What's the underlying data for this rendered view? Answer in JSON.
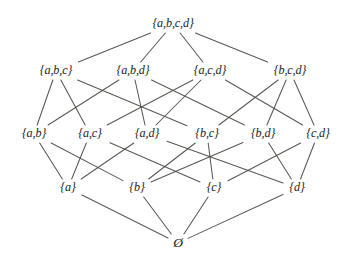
{
  "diagram": {
    "type": "hasse-lattice",
    "background_color": "#ffffff",
    "line_color": "#4a4a47",
    "text_color": "#1d1d1b",
    "width": 349,
    "height": 259,
    "levels": [
      {
        "rank": 4,
        "y": 24,
        "label": "four-element subsets"
      },
      {
        "rank": 3,
        "y": 71,
        "label": "three-element subsets"
      },
      {
        "rank": 2,
        "y": 134,
        "label": "two-element subsets"
      },
      {
        "rank": 1,
        "y": 188,
        "label": "one-element subsets"
      },
      {
        "rank": 0,
        "y": 243,
        "label": "empty set"
      }
    ],
    "nodes": [
      {
        "id": "abcd",
        "label": "{a,b,c,d}",
        "x": 173,
        "y": 24,
        "rank": 4,
        "w": 56,
        "h": 16
      },
      {
        "id": "abc",
        "label": "{a,b,c}",
        "x": 56,
        "y": 71,
        "rank": 3,
        "w": 46,
        "h": 16
      },
      {
        "id": "abd",
        "label": "{a,b,d}",
        "x": 133,
        "y": 71,
        "rank": 3,
        "w": 46,
        "h": 16
      },
      {
        "id": "acd",
        "label": "{a,c,d}",
        "x": 210,
        "y": 71,
        "rank": 3,
        "w": 46,
        "h": 16
      },
      {
        "id": "bcd",
        "label": "{b,c,d}",
        "x": 290,
        "y": 71,
        "rank": 3,
        "w": 46,
        "h": 16
      },
      {
        "id": "ab",
        "label": "{a,b}",
        "x": 34,
        "y": 134,
        "rank": 2,
        "w": 36,
        "h": 16
      },
      {
        "id": "ac",
        "label": "{a,c}",
        "x": 90,
        "y": 134,
        "rank": 2,
        "w": 36,
        "h": 16
      },
      {
        "id": "ad",
        "label": "{a,d}",
        "x": 147,
        "y": 134,
        "rank": 2,
        "w": 36,
        "h": 16
      },
      {
        "id": "bc",
        "label": "{b,c}",
        "x": 207,
        "y": 134,
        "rank": 2,
        "w": 36,
        "h": 16
      },
      {
        "id": "bd",
        "label": "{b,d}",
        "x": 263,
        "y": 134,
        "rank": 2,
        "w": 36,
        "h": 16
      },
      {
        "id": "cd",
        "label": "{c,d}",
        "x": 318,
        "y": 134,
        "rank": 2,
        "w": 36,
        "h": 16
      },
      {
        "id": "a",
        "label": "{a}",
        "x": 68,
        "y": 188,
        "rank": 1,
        "w": 24,
        "h": 16
      },
      {
        "id": "b",
        "label": "{b}",
        "x": 137,
        "y": 188,
        "rank": 1,
        "w": 24,
        "h": 16
      },
      {
        "id": "c",
        "label": "{c}",
        "x": 214,
        "y": 188,
        "rank": 1,
        "w": 24,
        "h": 16
      },
      {
        "id": "d",
        "label": "{d}",
        "x": 297,
        "y": 188,
        "rank": 1,
        "w": 24,
        "h": 16
      },
      {
        "id": "empty",
        "label": "Ø",
        "x": 178,
        "y": 243,
        "rank": 0,
        "w": 16,
        "h": 16
      }
    ],
    "edges": [
      {
        "from": "abcd",
        "to": "abc"
      },
      {
        "from": "abcd",
        "to": "abd"
      },
      {
        "from": "abcd",
        "to": "acd"
      },
      {
        "from": "abcd",
        "to": "bcd"
      },
      {
        "from": "abc",
        "to": "ab"
      },
      {
        "from": "abc",
        "to": "ac"
      },
      {
        "from": "abc",
        "to": "bc"
      },
      {
        "from": "abd",
        "to": "ab"
      },
      {
        "from": "abd",
        "to": "ad"
      },
      {
        "from": "abd",
        "to": "bd"
      },
      {
        "from": "acd",
        "to": "ac"
      },
      {
        "from": "acd",
        "to": "ad"
      },
      {
        "from": "acd",
        "to": "cd"
      },
      {
        "from": "bcd",
        "to": "bc"
      },
      {
        "from": "bcd",
        "to": "bd"
      },
      {
        "from": "bcd",
        "to": "cd"
      },
      {
        "from": "ab",
        "to": "a"
      },
      {
        "from": "ab",
        "to": "b"
      },
      {
        "from": "ac",
        "to": "a"
      },
      {
        "from": "ac",
        "to": "c"
      },
      {
        "from": "ad",
        "to": "a"
      },
      {
        "from": "ad",
        "to": "d"
      },
      {
        "from": "bc",
        "to": "b"
      },
      {
        "from": "bc",
        "to": "c"
      },
      {
        "from": "bd",
        "to": "b"
      },
      {
        "from": "bd",
        "to": "d"
      },
      {
        "from": "cd",
        "to": "c"
      },
      {
        "from": "cd",
        "to": "d"
      },
      {
        "from": "a",
        "to": "empty"
      },
      {
        "from": "b",
        "to": "empty"
      },
      {
        "from": "c",
        "to": "empty"
      },
      {
        "from": "d",
        "to": "empty"
      }
    ]
  }
}
